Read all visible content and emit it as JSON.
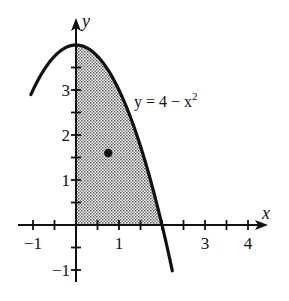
{
  "chart_data": {
    "type": "area",
    "title": "",
    "function": "y = 4 - x^2",
    "curve_label": {
      "prefix": "y = 4 − x",
      "exponent": "2"
    },
    "xlabel": "x",
    "ylabel": "y",
    "xlim": [
      -1,
      4.4
    ],
    "ylim": [
      -1.2,
      4.6
    ],
    "x_tick_step": 0.5,
    "y_tick_step": 0.5,
    "x_tick_labels": [
      {
        "value": -1,
        "label": "−1"
      },
      {
        "value": 1,
        "label": "1"
      },
      {
        "value": 3,
        "label": "3"
      },
      {
        "value": 4,
        "label": "4"
      }
    ],
    "y_tick_labels": [
      {
        "value": 3,
        "label": "3"
      },
      {
        "value": 2,
        "label": "2"
      },
      {
        "value": 1,
        "label": "1"
      },
      {
        "value": -1,
        "label": "−1"
      }
    ],
    "curve_domain": [
      -1.05,
      2.24
    ],
    "shaded_region": {
      "description": "Region bounded by y = 4 − x^2, x = 0 and y = 0 (first quadrant)",
      "x_range": [
        0,
        2
      ],
      "fill": "stippled gray"
    },
    "points": [
      {
        "name": "centroid",
        "x": 0.75,
        "y": 1.6
      }
    ],
    "grid": false,
    "legend": null
  },
  "layout": {
    "origin_px": [
      76,
      225
    ],
    "x_unit_px": 43,
    "y_unit_px": 45,
    "x_axis_px": [
      18,
      268
    ],
    "y_axis_px": [
      282,
      18
    ],
    "colors": {
      "ink": "#111111",
      "shade": "#b8b8b8",
      "background": "#ffffff"
    }
  }
}
